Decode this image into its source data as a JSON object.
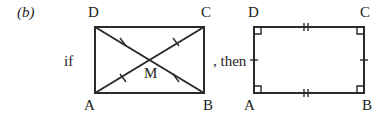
{
  "figure": {
    "part_label": "(b)",
    "connector_if": "if",
    "connector_then": ", then",
    "left_figure": {
      "vertices": {
        "top_left": "D",
        "top_right": "C",
        "bottom_left": "A",
        "bottom_right": "B"
      },
      "center_label": "M",
      "description": "Rectangle ABCD with diagonals AC and BD intersecting at M; single tick marks indicate MA = MB = MC = MD"
    },
    "right_figure": {
      "vertices": {
        "top_left": "D",
        "top_right": "C",
        "bottom_left": "A",
        "bottom_right": "B"
      },
      "description": "Quadrilateral ABCD with right angles at all four corners; double ticks on DC and AB, single ticks on AD and BC"
    }
  }
}
